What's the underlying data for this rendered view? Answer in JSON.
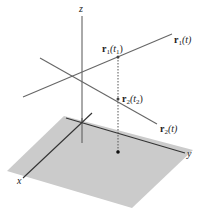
{
  "diagram": {
    "type": "3d-parametric-curves",
    "axes": {
      "x_label": "x",
      "y_label": "y",
      "z_label": "z"
    },
    "curves": [
      {
        "name": "r1",
        "label_bold": "r",
        "label_sub": "1",
        "label_arg": "(t)"
      },
      {
        "name": "r2",
        "label_bold": "r",
        "label_sub": "2",
        "label_arg": "(t)"
      }
    ],
    "points": [
      {
        "name": "r1-t1",
        "label_bold": "r",
        "label_sub": "1",
        "label_open": "(t",
        "label_argsub": "1",
        "label_close": ")"
      },
      {
        "name": "r2-t2",
        "label_bold": "r",
        "label_sub": "2",
        "label_open": "(t",
        "label_argsub": "2",
        "label_close": ")"
      }
    ],
    "colors": {
      "plane": "#c9c9c9",
      "lines": "#555555",
      "axes": "#333333"
    }
  }
}
